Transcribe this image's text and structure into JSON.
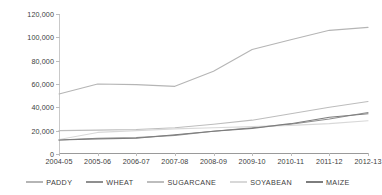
{
  "chart_data": {
    "type": "line",
    "title": "",
    "subtitle": "",
    "xlabel": "",
    "ylabel": "",
    "grid": false,
    "legend_position": "bottom",
    "ylim": [
      0,
      120000
    ],
    "yticks": [
      0,
      20000,
      40000,
      60000,
      80000,
      100000,
      120000
    ],
    "ytick_labels": [
      "0",
      "20,000",
      "40,000",
      "60,000",
      "80,000",
      "100,000",
      "120,000"
    ],
    "categories": [
      "2004-05",
      "2005-06",
      "2006-07",
      "2007-08",
      "2008-09",
      "2009-10",
      "2010-11",
      "2011-12",
      "2012-13"
    ],
    "series": [
      {
        "name": "PADDY",
        "color": "#b5b5b5",
        "values": [
          51500,
          60000,
          59500,
          58000,
          71000,
          89500,
          98000,
          106000,
          108500
        ]
      },
      {
        "name": "WHEAT",
        "color": "#8f8f8f",
        "values": [
          12000,
          13500,
          14000,
          16000,
          19500,
          22500,
          25500,
          30000,
          35500
        ]
      },
      {
        "name": "SUGARCANE",
        "color": "#bdbdbd",
        "values": [
          20000,
          20500,
          21000,
          22500,
          25500,
          29000,
          34500,
          40000,
          45000
        ]
      },
      {
        "name": "SOYABEAN",
        "color": "#d8d8d8",
        "values": [
          12500,
          18500,
          20000,
          21500,
          22500,
          23500,
          24500,
          26000,
          28500
        ]
      },
      {
        "name": "MAIZE",
        "color": "#7d7d7d",
        "values": [
          12000,
          13000,
          13500,
          16500,
          19500,
          22000,
          26000,
          31500,
          34500
        ]
      }
    ]
  },
  "legend": {
    "items": [
      {
        "label": "PADDY"
      },
      {
        "label": "WHEAT"
      },
      {
        "label": "SUGARCANE"
      },
      {
        "label": "SOYABEAN"
      },
      {
        "label": "MAIZE"
      }
    ]
  }
}
